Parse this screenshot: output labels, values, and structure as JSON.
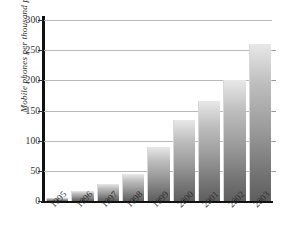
{
  "chart_data": {
    "type": "bar",
    "title": "",
    "subtitle": "",
    "xlabel": "",
    "ylabel": "Mobile phones per thousand people",
    "categories": [
      "1995",
      "1996",
      "1997",
      "1998",
      "1999",
      "2000",
      "2001",
      "2002",
      "2003"
    ],
    "values": [
      5,
      16,
      28,
      44,
      89,
      135,
      165,
      200,
      260
    ],
    "series": [
      {
        "name": "Mobile phones per thousand people",
        "values": [
          5,
          16,
          28,
          44,
          89,
          135,
          165,
          200,
          260
        ]
      }
    ],
    "ylim": [
      0,
      300
    ],
    "ytick_labels": [
      "0",
      "50",
      "100",
      "150",
      "200",
      "250",
      "300"
    ],
    "ytick_values": [
      0,
      50,
      100,
      150,
      200,
      250,
      300
    ],
    "grid": "horizontal",
    "legend": "none",
    "annotations": [],
    "colors": {
      "bar_top": "#e8e8e8",
      "bar_bottom": "#5e5e5e",
      "axis": "#111111",
      "gridline": "#b9b9b9",
      "text": "#2f2f2f",
      "background": "#ffffff"
    }
  }
}
